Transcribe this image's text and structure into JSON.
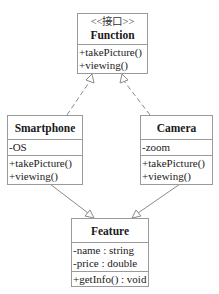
{
  "diagram": {
    "type": "uml-class-diagram",
    "classes": {
      "function": {
        "stereotype": "<<接口>>",
        "name": "Function",
        "attributes": [],
        "methods": [
          "+takePicture()",
          "+viewing()"
        ]
      },
      "smartphone": {
        "name": "Smartphone",
        "attributes": [
          "-OS"
        ],
        "methods": [
          "+takePicture()",
          "+viewing()"
        ]
      },
      "camera": {
        "name": "Camera",
        "attributes": [
          "-zoom"
        ],
        "methods": [
          "+takePicture()",
          "+viewing()"
        ]
      },
      "feature": {
        "name": "Feature",
        "attributes": [
          "-name : string",
          "-price : double"
        ],
        "methods": [
          "+getInfo() : void"
        ]
      }
    },
    "relations": [
      {
        "from": "Smartphone",
        "to": "Function",
        "kind": "realization",
        "line": "dashed",
        "head": "hollow-triangle"
      },
      {
        "from": "Camera",
        "to": "Function",
        "kind": "realization",
        "line": "dashed",
        "head": "hollow-triangle"
      },
      {
        "from": "Smartphone",
        "to": "Feature",
        "kind": "generalization",
        "line": "solid",
        "head": "hollow-triangle"
      },
      {
        "from": "Camera",
        "to": "Feature",
        "kind": "generalization",
        "line": "solid",
        "head": "hollow-triangle"
      }
    ],
    "colors": {
      "border": "#9a9a9a",
      "line": "#8a8a8a",
      "text": "#1a1a1a",
      "background": "#ffffff"
    }
  }
}
